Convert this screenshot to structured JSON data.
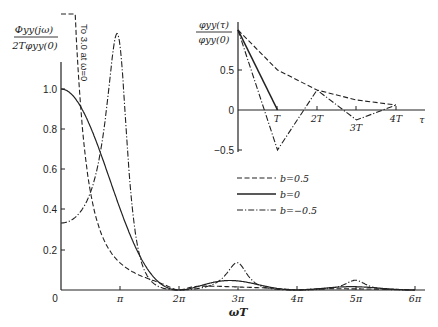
{
  "chart_data": [
    {
      "type": "line",
      "title": "",
      "ylabel_num": "Φyy(jω)",
      "ylabel_den": "2T φyy(0)",
      "xlabel": "ωT",
      "x_ticks": [
        "0",
        "π",
        "2π",
        "3π",
        "4π",
        "5π",
        "6π"
      ],
      "y_ticks": [
        "0.2",
        "0.4",
        "0.6",
        "0.8",
        "1.0"
      ],
      "annotation": "To 3.0 at ω=0",
      "xlim_pi": [
        0,
        6
      ],
      "ylim": [
        0,
        1.3
      ],
      "x_pi": [
        0,
        0.125,
        0.25,
        0.375,
        0.5,
        0.625,
        0.75,
        0.875,
        1,
        1.125,
        1.25,
        1.375,
        1.5,
        1.625,
        1.75,
        1.875,
        2,
        2.125,
        2.25,
        2.375,
        2.5,
        2.625,
        2.75,
        2.875,
        3,
        3.125,
        3.25,
        3.375,
        3.5,
        3.625,
        3.75,
        3.875,
        4,
        4.125,
        4.25,
        4.375,
        4.5,
        4.625,
        4.75,
        4.875,
        5,
        5.125,
        5.25,
        5.375,
        5.5,
        5.625,
        5.75,
        5.875,
        6
      ],
      "series": [
        {
          "name": "b=0.5",
          "style": "dashed",
          "values": [
            3.0,
            2.62,
            1.77,
            1.1,
            0.73,
            0.52,
            0.41,
            0.37,
            0.405,
            0.3,
            0.19,
            0.1,
            0.04,
            0.012,
            0.001,
            0.001,
            0,
            0.001,
            0.006,
            0.01,
            0.01,
            0.011,
            0.013,
            0.014,
            0.015,
            0.013,
            0.009,
            0.005,
            0.002,
            0.0006,
            0.0001,
            0.0001,
            0,
            0.0001,
            0.002,
            0.003,
            0.003,
            0.004,
            0.005,
            0.005,
            0.005,
            0.005,
            0.004,
            0.002,
            0.001,
            0.0003,
            0,
            0,
            0
          ]
        },
        {
          "name": "b=0",
          "style": "solid",
          "values": [
            1.0,
            0.99,
            0.95,
            0.89,
            0.81,
            0.72,
            0.63,
            0.52,
            0.405,
            0.32,
            0.23,
            0.15,
            0.09,
            0.045,
            0.015,
            0.003,
            0,
            0.003,
            0.011,
            0.023,
            0.032,
            0.04,
            0.045,
            0.046,
            0.045,
            0.04,
            0.033,
            0.023,
            0.017,
            0.01,
            0.004,
            0.001,
            0,
            0.001,
            0.004,
            0.008,
            0.01,
            0.013,
            0.016,
            0.017,
            0.016,
            0.014,
            0.012,
            0.008,
            0.006,
            0.004,
            0.002,
            0.0005,
            0
          ]
        },
        {
          "name": "b=-0.5",
          "style": "dashdot",
          "values": [
            0.333,
            0.35,
            0.41,
            0.56,
            0.81,
            0.97,
            1.12,
            1.2,
            1.216,
            1.17,
            0.97,
            0.57,
            0.27,
            0.1,
            0.03,
            0.004,
            0,
            0.003,
            0.011,
            0.025,
            0.04,
            0.068,
            0.1,
            0.126,
            0.135,
            0.12,
            0.082,
            0.048,
            0.022,
            0.008,
            0.002,
            0.0003,
            0,
            0.0003,
            0.002,
            0.006,
            0.013,
            0.025,
            0.038,
            0.048,
            0.049,
            0.044,
            0.032,
            0.017,
            0.007,
            0.002,
            0.0004,
            0,
            0
          ]
        }
      ]
    },
    {
      "type": "line",
      "title": "inset",
      "ylabel_num": "φyy(τ)",
      "ylabel_den": "φyy(0)",
      "xlabel": "τ",
      "x_ticks": [
        "T",
        "2T",
        "3T",
        "4T"
      ],
      "y_ticks": [
        "0.5",
        "0",
        "-0.5"
      ],
      "xlim": [
        0,
        4.5
      ],
      "ylim": [
        -0.5,
        1.0
      ],
      "series": [
        {
          "name": "b=0.5",
          "style": "dashed",
          "x": [
            0,
            1,
            2,
            3,
            4
          ],
          "values": [
            1.0,
            0.5,
            0.25,
            0.125,
            0.0625
          ]
        },
        {
          "name": "b=0",
          "style": "solid",
          "x": [
            0,
            1
          ],
          "values": [
            1.0,
            0
          ]
        },
        {
          "name": "b=-0.5",
          "style": "dashdot",
          "x": [
            0,
            1,
            2,
            3,
            4
          ],
          "values": [
            1.0,
            -0.5,
            0.25,
            -0.125,
            0.0625
          ]
        }
      ]
    }
  ],
  "legend": [
    {
      "label": "b=0.5",
      "style": "dashed"
    },
    {
      "label": "b=0",
      "style": "solid"
    },
    {
      "label": "b=−0.5",
      "style": "dashdot"
    }
  ],
  "main": {
    "ylabel_num": "Φyy(jω)",
    "ylabel_den": "2Tφyy(0)",
    "xlabel": "ωT",
    "annotation": "To 3.0 at ω=0",
    "y_ticks": {
      "t10": "1.0",
      "t08": "0.8",
      "t06": "0.6",
      "t04": "0.4",
      "t02": "0.2",
      "t0": "0"
    },
    "x_ticks": {
      "p1": "π",
      "p2": "2π",
      "p3": "3π",
      "p4": "4π",
      "p5": "5π",
      "p6": "6π"
    }
  },
  "inset": {
    "ylabel_num": "φyy(τ)",
    "ylabel_den": "φyy(0)",
    "xlabel": "τ",
    "y_ticks": {
      "p05": "0.5",
      "z": "0",
      "m05": "−0.5"
    },
    "x_ticks": {
      "t1": "T",
      "t2": "2T",
      "t3": "3T",
      "t4": "4T"
    }
  },
  "legend_labels": {
    "b05": "b=0.5",
    "b0": "b=0",
    "bm05": "b=−0.5"
  }
}
